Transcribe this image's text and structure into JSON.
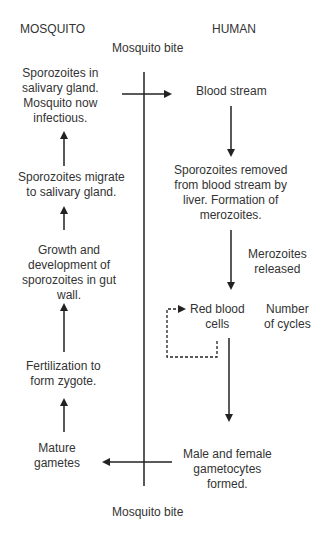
{
  "headers": {
    "mosquito": "MOSQUITO",
    "human": "HUMAN"
  },
  "bite_labels": {
    "top": "Mosquito bite",
    "bottom": "Mosquito bite"
  },
  "mosquito_stages": [
    {
      "lines": [
        "Sporozoites in",
        "salivary gland.",
        "Mosquito now",
        "infectious."
      ]
    },
    {
      "lines": [
        "Sporozoites migrate",
        "to salivary gland."
      ]
    },
    {
      "lines": [
        "Growth and",
        "development of",
        "sporozoites in gut",
        "wall."
      ]
    },
    {
      "lines": [
        "Fertilization to",
        "form zygote."
      ]
    },
    {
      "lines": [
        "Mature",
        "gametes"
      ]
    }
  ],
  "human_stages": [
    {
      "lines": [
        "Blood stream"
      ]
    },
    {
      "lines": [
        "Sporozoites removed",
        "from blood stream by",
        "liver. Formation of",
        "merozoites."
      ]
    },
    {
      "lines": [
        "Red blood",
        "cells"
      ]
    },
    {
      "lines": [
        "Male and female",
        "gametocytes",
        "formed."
      ]
    }
  ],
  "annotations": {
    "merozoites": [
      "Merozoites",
      "released"
    ],
    "cycles": [
      "Number",
      "of cycles"
    ]
  },
  "colors": {
    "text": "#333333",
    "line": "#222222"
  }
}
